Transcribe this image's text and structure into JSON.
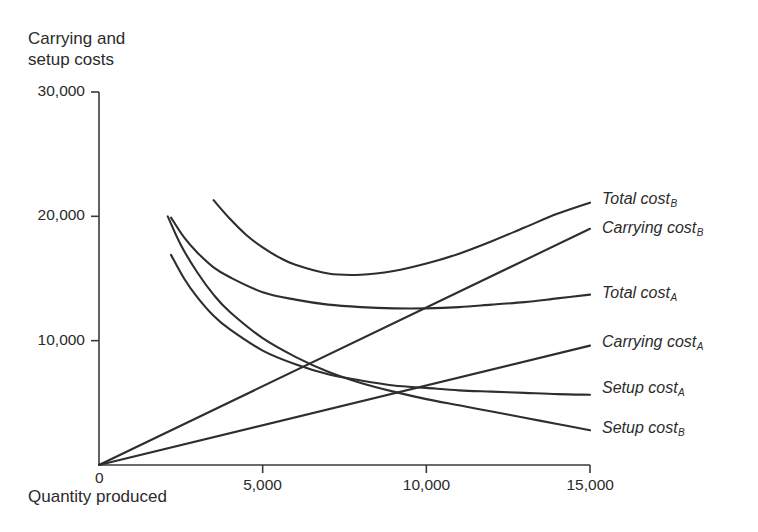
{
  "chart_data": {
    "type": "line",
    "title": "",
    "ylabel": "Carrying and\nsetup costs",
    "ylabel_line1": "Carrying and",
    "ylabel_line2": "setup costs",
    "xlabel": "Quantity produced",
    "xlim": [
      0,
      15000
    ],
    "ylim": [
      0,
      30000
    ],
    "xticks": [
      0,
      5000,
      10000,
      15000
    ],
    "xticklabels": [
      "0",
      "5,000",
      "10,000",
      "15,000"
    ],
    "yticks": [
      0,
      10000,
      20000,
      30000
    ],
    "yticklabels": [
      "0",
      "10,000",
      "20,000",
      "30,000"
    ],
    "grid": false,
    "legend_position": "right-of-axes-inline",
    "line_color": "#2e2e2e",
    "series": [
      {
        "name": "Total cost_B",
        "label_text": "Total cost",
        "label_sub": "B",
        "label_x": 15000,
        "label_y": 21200,
        "x": [
          3500,
          4000,
          4500,
          5000,
          5500,
          6000,
          7000,
          8000,
          9000,
          10000,
          11000,
          12000,
          13000,
          14000,
          15000
        ],
        "y": [
          21300,
          19800,
          18500,
          17500,
          16700,
          16100,
          15400,
          15300,
          15600,
          16200,
          17000,
          18000,
          19100,
          20200,
          21100
        ]
      },
      {
        "name": "Carrying cost_B",
        "label_text": "Carrying cost",
        "label_sub": "B",
        "label_x": 15000,
        "label_y": 18900,
        "x": [
          0,
          15000
        ],
        "y": [
          0,
          19000
        ]
      },
      {
        "name": "Total cost_A",
        "label_text": "Total cost",
        "label_sub": "A",
        "label_x": 15000,
        "label_y": 13700,
        "x": [
          2200,
          2600,
          3000,
          3500,
          4000,
          5000,
          6000,
          7000,
          8000,
          9000,
          10000,
          11000,
          12000,
          13000,
          14000,
          15000
        ],
        "y": [
          19900,
          18300,
          17100,
          15900,
          15100,
          13900,
          13300,
          12900,
          12700,
          12600,
          12600,
          12700,
          12900,
          13100,
          13400,
          13700
        ]
      },
      {
        "name": "Carrying cost_A",
        "label_text": "Carrying cost",
        "label_sub": "A",
        "label_x": 15000,
        "label_y": 9700,
        "x": [
          0,
          15000
        ],
        "y": [
          0,
          9600
        ]
      },
      {
        "name": "Setup cost_A",
        "label_text": "Setup cost",
        "label_sub": "A",
        "label_x": 15000,
        "label_y": 6000,
        "x": [
          2200,
          2600,
          3000,
          3500,
          4000,
          5000,
          6000,
          7000,
          8000,
          9000,
          10000,
          11000,
          12000,
          13000,
          14000,
          15000
        ],
        "y": [
          16900,
          15000,
          13500,
          12000,
          10900,
          9200,
          8100,
          7300,
          6800,
          6400,
          6200,
          6000,
          5900,
          5800,
          5700,
          5650
        ]
      },
      {
        "name": "Setup cost_B",
        "label_text": "Setup cost",
        "label_sub": "B",
        "label_x": 15000,
        "label_y": 2800,
        "x": [
          2100,
          2500,
          3000,
          3500,
          4000,
          5000,
          6000,
          7000,
          8000,
          9000,
          10000,
          11000,
          12000,
          13000,
          14000,
          15000
        ],
        "y": [
          20000,
          17700,
          15500,
          13700,
          12300,
          10200,
          8700,
          7500,
          6600,
          5900,
          5300,
          4800,
          4300,
          3800,
          3300,
          2800
        ]
      }
    ]
  },
  "axes": {
    "y_title_line1": "Carrying and",
    "y_title_line2": "setup costs",
    "x_title": "Quantity produced"
  }
}
